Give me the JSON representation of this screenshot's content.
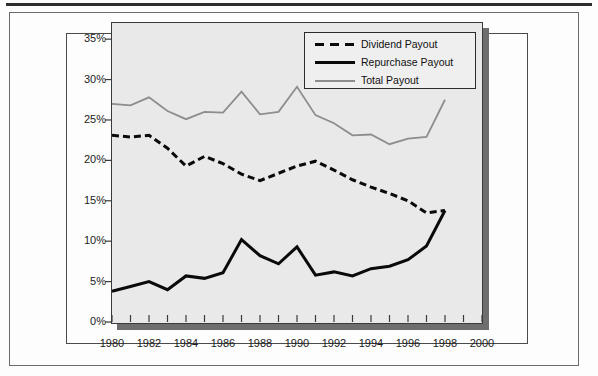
{
  "figure": {
    "background_color": "#fdfdfd",
    "plot_background_color": "#e9e9e9",
    "shadow_color": "#6e6e6e"
  },
  "legend": {
    "position": "top-right-inside",
    "entries": [
      {
        "label": "Dividend Payout",
        "style": "dashed",
        "color": "#0a0a0a",
        "icon": "dashed-line-swatch"
      },
      {
        "label": "Repurchase Payout",
        "style": "solid-thick",
        "color": "#0a0a0a",
        "icon": "solid-line-swatch"
      },
      {
        "label": "Total Payout",
        "style": "solid-thin",
        "color": "#8d8d8d",
        "icon": "gray-line-swatch"
      }
    ]
  },
  "axes": {
    "y_ticks": [
      "0%",
      "5%",
      "10%",
      "15%",
      "20%",
      "25%",
      "30%",
      "35%"
    ],
    "x_ticks": [
      "1980",
      "1982",
      "1984",
      "1986",
      "1988",
      "1990",
      "1992",
      "1994",
      "1996",
      "1998",
      "2000"
    ]
  },
  "chart_data": {
    "type": "line",
    "title": "",
    "xlabel": "",
    "ylabel": "",
    "xlim": [
      1980,
      2000
    ],
    "ylim": [
      0,
      37
    ],
    "ytick_values": [
      0,
      5,
      10,
      15,
      20,
      25,
      30,
      35
    ],
    "ytick_labels": [
      "0%",
      "5%",
      "10%",
      "15%",
      "20%",
      "25%",
      "30%",
      "35%"
    ],
    "xtick_values": [
      1980,
      1982,
      1984,
      1986,
      1988,
      1990,
      1992,
      1994,
      1996,
      1998,
      2000
    ],
    "xtick_labels": [
      "1980",
      "1982",
      "1984",
      "1986",
      "1988",
      "1990",
      "1992",
      "1994",
      "1996",
      "1998",
      "2000"
    ],
    "minor_xticks": "every 1 year",
    "grid": false,
    "legend_position": "upper right",
    "x": [
      1980,
      1981,
      1982,
      1983,
      1984,
      1985,
      1986,
      1987,
      1988,
      1989,
      1990,
      1991,
      1992,
      1993,
      1994,
      1995,
      1996,
      1997,
      1998
    ],
    "series": [
      {
        "name": "Dividend Payout",
        "style": "dashed",
        "color": "#0a0a0a",
        "values": [
          23.1,
          22.9,
          23.1,
          21.5,
          19.3,
          20.5,
          19.6,
          18.3,
          17.5,
          18.4,
          19.3,
          19.9,
          18.8,
          17.6,
          16.7,
          15.9,
          15.0,
          13.5,
          13.8
        ]
      },
      {
        "name": "Repurchase Payout",
        "style": "solid",
        "color": "#0a0a0a",
        "values": [
          3.8,
          4.4,
          5.0,
          4.0,
          5.7,
          5.4,
          6.1,
          10.2,
          8.2,
          7.2,
          9.3,
          5.8,
          6.2,
          5.7,
          6.6,
          6.9,
          7.7,
          9.4,
          13.8
        ]
      },
      {
        "name": "Total Payout",
        "style": "solid",
        "color": "#8d8d8d",
        "values": [
          27.0,
          26.8,
          27.8,
          26.1,
          25.1,
          26.0,
          25.9,
          28.5,
          25.7,
          26.0,
          29.1,
          25.6,
          24.6,
          23.1,
          23.2,
          22.0,
          22.7,
          22.9,
          27.5
        ]
      }
    ]
  }
}
